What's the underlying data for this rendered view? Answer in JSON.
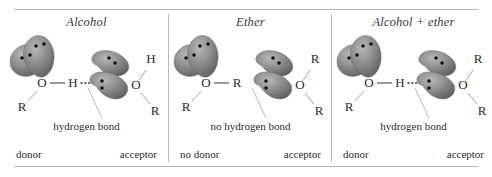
{
  "figure": {
    "background_color": "#ffffff",
    "rule_color": "#b9b9b9",
    "lobe_color": "#8a8a8a",
    "lobe_shadow_color": "#5c5c5c",
    "lobe_highlight_color": "#b5b5b5",
    "text_color": "#2b2b2b",
    "bond_color": "#4a4a4a"
  },
  "panels": [
    {
      "title": "Alcohol",
      "donor": {
        "oxygen": "O",
        "substituent": "R",
        "bonded_atom": "H",
        "lone_pairs": 2
      },
      "acceptor": {
        "oxygen": "O",
        "upper_substituent": "H",
        "lower_substituent": "R",
        "lone_pairs": 2
      },
      "bond_label": "hydrogen bond",
      "has_hydrogen_bond": true,
      "donor_role": "donor",
      "acceptor_role": "acceptor"
    },
    {
      "title": "Ether",
      "donor": {
        "oxygen": "O",
        "substituent": "R",
        "bonded_atom": "R",
        "lone_pairs": 2
      },
      "acceptor": {
        "oxygen": "O",
        "upper_substituent": "R",
        "lower_substituent": "R",
        "lone_pairs": 2
      },
      "bond_label": "no hydrogen bond",
      "has_hydrogen_bond": false,
      "donor_role": "no donor",
      "acceptor_role": "acceptor"
    },
    {
      "title": "Alcohol + ether",
      "donor": {
        "oxygen": "O",
        "substituent": "R",
        "bonded_atom": "H",
        "lone_pairs": 2
      },
      "acceptor": {
        "oxygen": "O",
        "upper_substituent": "R",
        "lower_substituent": "R",
        "lone_pairs": 2
      },
      "bond_label": "hydrogen bond",
      "has_hydrogen_bond": true,
      "donor_role": "donor",
      "acceptor_role": "acceptor"
    }
  ]
}
